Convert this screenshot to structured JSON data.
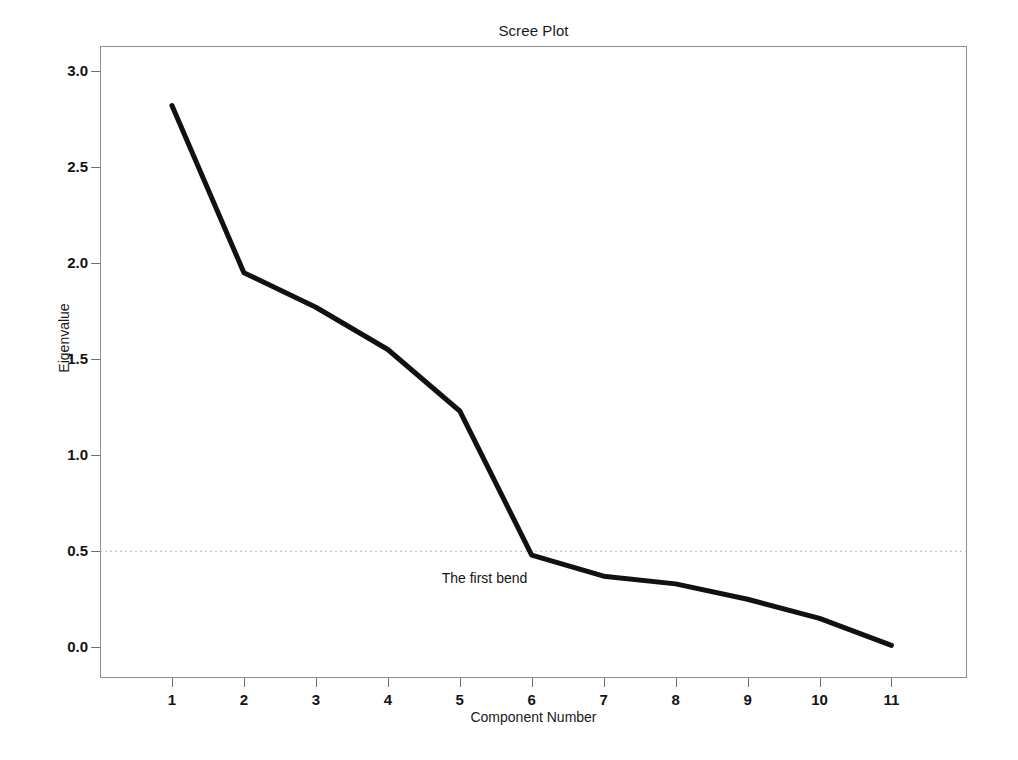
{
  "chart_data": {
    "type": "line",
    "title": "Scree Plot",
    "xlabel": "Component Number",
    "ylabel": "Eigenvalue",
    "x": [
      1,
      2,
      3,
      4,
      5,
      6,
      7,
      8,
      9,
      10,
      11
    ],
    "values": [
      2.82,
      1.95,
      1.77,
      1.55,
      1.23,
      0.48,
      0.37,
      0.33,
      0.25,
      0.15,
      0.01
    ],
    "series": [
      {
        "name": "Eigenvalue",
        "values": [
          2.82,
          1.95,
          1.77,
          1.55,
          1.23,
          0.48,
          0.37,
          0.33,
          0.25,
          0.15,
          0.01
        ]
      }
    ],
    "categories": [
      "1",
      "2",
      "3",
      "4",
      "5",
      "6",
      "7",
      "8",
      "9",
      "10",
      "11"
    ],
    "xlim": [
      0.0,
      12.05
    ],
    "ylim": [
      -0.16,
      3.13
    ],
    "xticks": [
      "1",
      "2",
      "3",
      "4",
      "5",
      "6",
      "7",
      "8",
      "9",
      "10",
      "11"
    ],
    "yticks": [
      "0.0",
      "0.5",
      "1.0",
      "1.5",
      "2.0",
      "2.5",
      "3.0"
    ],
    "ytick_values": [
      0.0,
      0.5,
      1.0,
      1.5,
      2.0,
      2.5,
      3.0
    ],
    "grid": false,
    "legend": false,
    "reference_line": {
      "value": 0.5,
      "style": "dotted",
      "color": "#b8b8b8"
    },
    "annotations": [
      {
        "text": "The first bend",
        "x": 6,
        "y": 0.35,
        "name": "first-bend-annotation"
      }
    ],
    "line_color": "#111111",
    "line_width": 5,
    "background_color": "#ffffff",
    "frame_color": "#8f8f8f"
  },
  "chart": {
    "title": "Scree Plot",
    "x_axis_title": "Component Number",
    "y_axis_title": "Eigenvalue",
    "annotation": "The first bend",
    "y_ticks": [
      "3.0",
      "2.5",
      "2.0",
      "1.5",
      "1.0",
      "0.5",
      "0.0"
    ],
    "x_ticks": [
      "1",
      "2",
      "3",
      "4",
      "5",
      "6",
      "7",
      "8",
      "9",
      "10",
      "11"
    ]
  }
}
